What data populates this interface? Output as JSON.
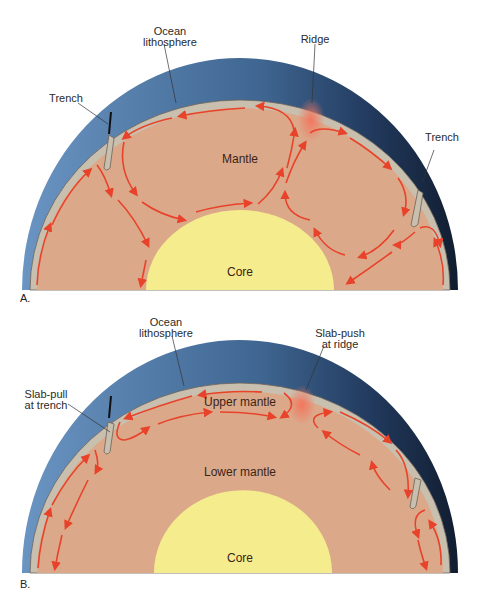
{
  "colors": {
    "ocean_light": "#5b86b6",
    "ocean_dark": "#1d3150",
    "lithosphere": "#c9bfae",
    "lithosphere_edge": "#6b6258",
    "mantle": "#dba98a",
    "core": "#f5ec8e",
    "arrow": "#e8432a",
    "ridge_glow": "#f0806a"
  },
  "panels": [
    {
      "id": "A",
      "tag": "A.",
      "labels": {
        "ocean_lithosphere": "Ocean\nlithosphere",
        "ridge": "Ridge",
        "trench_left": "Trench",
        "trench_right": "Trench",
        "mantle": "Mantle",
        "core": "Core"
      }
    },
    {
      "id": "B",
      "tag": "B.",
      "labels": {
        "ocean_lithosphere": "Ocean\nlithosphere",
        "slab_push": "Slab-push\nat ridge",
        "slab_pull": "Slab-pull\nat trench",
        "upper_mantle": "Upper mantle",
        "lower_mantle": "Lower mantle",
        "core": "Core"
      }
    }
  ]
}
